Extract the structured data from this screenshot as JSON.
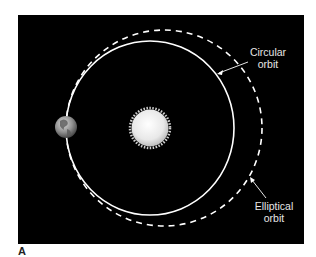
{
  "figure": {
    "panel_label": "A",
    "background_color": "#000000",
    "labels": {
      "circular": {
        "line1": "Circular",
        "line2": "orbit"
      },
      "elliptical": {
        "line1": "Elliptical",
        "line2": "orbit"
      }
    },
    "objects": [
      {
        "name": "Sun",
        "icon": "sun-icon",
        "color": "#f2f2f2"
      },
      {
        "name": "Earth",
        "icon": "earth-icon",
        "color": "#8a8a8a"
      }
    ],
    "orbits": [
      {
        "type": "circular",
        "style": "solid",
        "color": "#ffffff"
      },
      {
        "type": "elliptical",
        "style": "dashed",
        "color": "#ffffff"
      }
    ]
  }
}
